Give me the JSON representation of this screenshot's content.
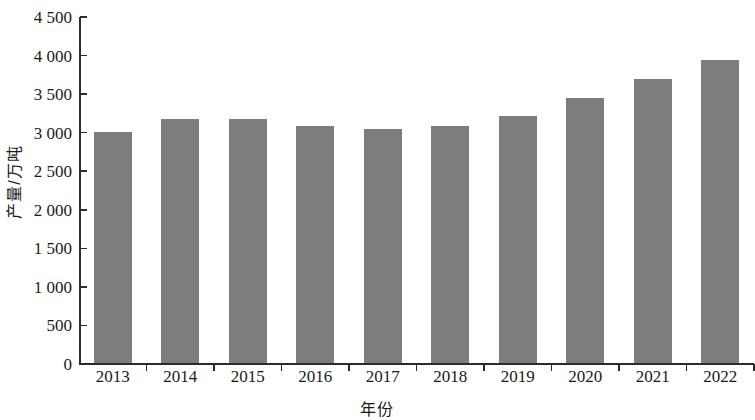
{
  "chart_data": {
    "type": "bar",
    "title": "",
    "xlabel": "年份",
    "ylabel": "产量/万吨",
    "categories": [
      "2013",
      "2014",
      "2015",
      "2016",
      "2017",
      "2018",
      "2019",
      "2020",
      "2021",
      "2022"
    ],
    "values": [
      3000,
      3160,
      3170,
      3070,
      3040,
      3070,
      3200,
      3440,
      3680,
      3930
    ],
    "series": [
      {
        "name": "产量",
        "values": [
          3000,
          3160,
          3170,
          3070,
          3040,
          3070,
          3200,
          3440,
          3680,
          3930
        ]
      }
    ],
    "ylim": [
      0,
      4500
    ],
    "ytick_values": [
      0,
      500,
      1000,
      1500,
      2000,
      2500,
      3000,
      3500,
      4000,
      4500
    ],
    "ytick_labels": [
      "0",
      "500",
      "1 000",
      "1 500",
      "2 000",
      "2 500",
      "3 000",
      "3 500",
      "4 000",
      "4 500"
    ],
    "xtick_labels": [
      "2013",
      "2014",
      "2015",
      "2016",
      "2017",
      "2018",
      "2019",
      "2020",
      "2021",
      "2022"
    ],
    "grid": false,
    "legend": "none",
    "bar_color": "#7d7d7d",
    "axis_color": "#2b2b2b"
  }
}
